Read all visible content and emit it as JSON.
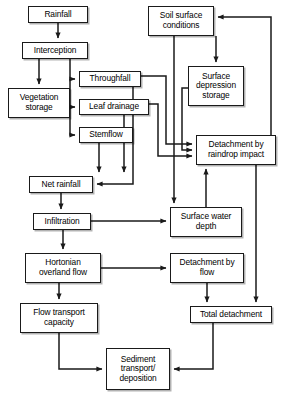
{
  "diagram": {
    "type": "flowchart",
    "style": {
      "box_fill": "#ffffff",
      "box_stroke": "#1a1a1a",
      "arrow_color": "#1a1a1a",
      "shadow": "#4d4d4d",
      "background": "#ffffff"
    },
    "nodes": [
      {
        "id": "rainfall",
        "label": "Rainfall",
        "x": 28,
        "y": 6,
        "w": 60,
        "h": 17
      },
      {
        "id": "interception",
        "label": "Interception",
        "x": 22,
        "y": 42,
        "w": 66,
        "h": 17
      },
      {
        "id": "vegetation_storage",
        "label": "Vegetation\nstorage",
        "x": 8,
        "y": 88,
        "w": 62,
        "h": 30
      },
      {
        "id": "throughfall",
        "label": "Throughfall",
        "x": 79,
        "y": 71,
        "w": 62,
        "h": 16
      },
      {
        "id": "leaf_drainage",
        "label": "Leaf drainage",
        "x": 79,
        "y": 99,
        "w": 70,
        "h": 16
      },
      {
        "id": "stemflow",
        "label": "Stemflow",
        "x": 79,
        "y": 127,
        "w": 54,
        "h": 16
      },
      {
        "id": "soil_surface",
        "label": "Soil surface\nconditions",
        "x": 148,
        "y": 6,
        "w": 66,
        "h": 30
      },
      {
        "id": "surface_depression",
        "label": "Surface\ndepression\nstorage",
        "x": 188,
        "y": 66,
        "w": 56,
        "h": 40
      },
      {
        "id": "detach_raindrop",
        "label": "Detachment by\nraindrop impact",
        "x": 196,
        "y": 135,
        "w": 80,
        "h": 30
      },
      {
        "id": "net_rainfall",
        "label": "Net rainfall",
        "x": 29,
        "y": 176,
        "w": 64,
        "h": 17
      },
      {
        "id": "infiltration",
        "label": "Infiltration",
        "x": 33,
        "y": 213,
        "w": 58,
        "h": 17
      },
      {
        "id": "surface_water",
        "label": "Surface water\ndepth",
        "x": 170,
        "y": 207,
        "w": 72,
        "h": 30
      },
      {
        "id": "hortonian",
        "label": "Hortonian\noverland flow",
        "x": 25,
        "y": 253,
        "w": 76,
        "h": 30
      },
      {
        "id": "detach_flow",
        "label": "Detachment by\nflow",
        "x": 170,
        "y": 253,
        "w": 74,
        "h": 30
      },
      {
        "id": "flow_transport",
        "label": "Flow transport\ncapacity",
        "x": 20,
        "y": 303,
        "w": 78,
        "h": 30
      },
      {
        "id": "total_detachment",
        "label": "Total detachment",
        "x": 190,
        "y": 306,
        "w": 82,
        "h": 17
      },
      {
        "id": "sediment",
        "label": "Sediment\ntransport/\ndeposition",
        "x": 106,
        "y": 348,
        "w": 64,
        "h": 42
      }
    ],
    "edges": [
      {
        "from": "rainfall",
        "to": "interception",
        "label": ""
      },
      {
        "from": "interception",
        "to": "vegetation_storage",
        "label": ""
      },
      {
        "from": "interception",
        "to": "throughfall",
        "label": ""
      },
      {
        "from": "interception",
        "to": "leaf_drainage",
        "label": ""
      },
      {
        "from": "interception",
        "to": "stemflow",
        "label": ""
      },
      {
        "from": "throughfall",
        "to": "detach_raindrop",
        "label": ""
      },
      {
        "from": "throughfall",
        "to": "net_rainfall",
        "label": ""
      },
      {
        "from": "leaf_drainage",
        "to": "detach_raindrop",
        "label": ""
      },
      {
        "from": "leaf_drainage",
        "to": "net_rainfall",
        "label": ""
      },
      {
        "from": "stemflow",
        "to": "net_rainfall",
        "label": ""
      },
      {
        "from": "soil_surface",
        "to": "surface_depression",
        "label": ""
      },
      {
        "from": "soil_surface",
        "to": "surface_water",
        "label": ""
      },
      {
        "from": "surface_depression",
        "to": "detach_raindrop",
        "label": ""
      },
      {
        "from": "net_rainfall",
        "to": "infiltration",
        "label": ""
      },
      {
        "from": "infiltration",
        "to": "surface_water",
        "label": ""
      },
      {
        "from": "infiltration",
        "to": "hortonian",
        "label": ""
      },
      {
        "from": "hortonian",
        "to": "detach_flow",
        "label": ""
      },
      {
        "from": "hortonian",
        "to": "flow_transport",
        "label": ""
      },
      {
        "from": "surface_water",
        "to": "detach_raindrop",
        "label": ""
      },
      {
        "from": "detach_flow",
        "to": "total_detachment",
        "label": ""
      },
      {
        "from": "detach_raindrop",
        "to": "total_detachment",
        "label": ""
      },
      {
        "from": "total_detachment",
        "to": "sediment",
        "label": ""
      },
      {
        "from": "flow_transport",
        "to": "sediment",
        "label": ""
      },
      {
        "from": "sediment",
        "to": "soil_surface",
        "label": ""
      }
    ]
  }
}
